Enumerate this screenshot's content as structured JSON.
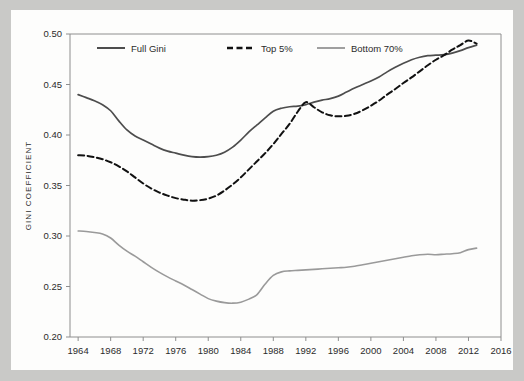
{
  "figure": {
    "background_color": "#c9c9c7",
    "plot_background_color": "#fdfdfc",
    "axis_color": "#8e8e8e"
  },
  "chart_data": {
    "type": "line",
    "title": "",
    "xlabel": "",
    "ylabel": "GINI COEFFICIENT",
    "xlim": [
      1963,
      2016
    ],
    "ylim": [
      0.2,
      0.5
    ],
    "grid": false,
    "legend_position": "top-left-inside",
    "xticks": [
      1964,
      1968,
      1972,
      1976,
      1980,
      1984,
      1988,
      1992,
      1996,
      2000,
      2004,
      2008,
      2012,
      2016
    ],
    "xtick_labels": [
      "1964",
      "1968",
      "1972",
      "1976",
      "1980",
      "1984",
      "1988",
      "1992",
      "1996",
      "2000",
      "2004",
      "2008",
      "2012",
      "2016"
    ],
    "yticks": [
      0.2,
      0.25,
      0.3,
      0.35,
      0.4,
      0.45,
      0.5
    ],
    "ytick_labels": [
      "0.20",
      "0.25",
      "0.30",
      "0.35",
      "0.40",
      "0.45",
      "0.50"
    ],
    "x": [
      1964,
      1965,
      1966,
      1967,
      1968,
      1969,
      1970,
      1971,
      1972,
      1973,
      1974,
      1975,
      1976,
      1977,
      1978,
      1979,
      1980,
      1981,
      1982,
      1983,
      1984,
      1985,
      1986,
      1987,
      1988,
      1989,
      1990,
      1991,
      1992,
      1993,
      1994,
      1995,
      1996,
      1997,
      1998,
      1999,
      2000,
      2001,
      2002,
      2003,
      2004,
      2005,
      2006,
      2007,
      2008,
      2009,
      2010,
      2011,
      2012,
      2013
    ],
    "series": [
      {
        "name": "Full Gini",
        "color": "#4d4d4d",
        "style": "solid",
        "width": 1.7,
        "values": [
          0.44,
          0.437,
          0.434,
          0.43,
          0.424,
          0.414,
          0.405,
          0.399,
          0.395,
          0.391,
          0.387,
          0.384,
          0.382,
          0.38,
          0.3785,
          0.378,
          0.3785,
          0.38,
          0.383,
          0.388,
          0.395,
          0.403,
          0.41,
          0.417,
          0.4235,
          0.4265,
          0.428,
          0.4285,
          0.43,
          0.4325,
          0.4345,
          0.436,
          0.4385,
          0.4425,
          0.4465,
          0.45,
          0.4535,
          0.4575,
          0.4625,
          0.467,
          0.471,
          0.4745,
          0.477,
          0.4785,
          0.479,
          0.4795,
          0.481,
          0.4835,
          0.4865,
          0.489
        ]
      },
      {
        "name": "Top 5%",
        "color": "#111111",
        "style": "dashed",
        "width": 2.0,
        "values": [
          0.38,
          0.3795,
          0.378,
          0.376,
          0.373,
          0.369,
          0.364,
          0.358,
          0.352,
          0.347,
          0.343,
          0.34,
          0.3375,
          0.336,
          0.335,
          0.3355,
          0.337,
          0.34,
          0.345,
          0.351,
          0.358,
          0.366,
          0.374,
          0.382,
          0.391,
          0.401,
          0.411,
          0.423,
          0.4325,
          0.4275,
          0.4225,
          0.4195,
          0.4185,
          0.419,
          0.421,
          0.4245,
          0.429,
          0.434,
          0.44,
          0.4455,
          0.4515,
          0.457,
          0.463,
          0.469,
          0.4745,
          0.479,
          0.4845,
          0.489,
          0.4935,
          0.4905
        ]
      },
      {
        "name": "Bottom 70%",
        "color": "#9a9a9a",
        "style": "solid",
        "width": 1.6,
        "values": [
          0.305,
          0.3045,
          0.3035,
          0.302,
          0.298,
          0.291,
          0.285,
          0.28,
          0.2745,
          0.269,
          0.264,
          0.2595,
          0.2555,
          0.2515,
          0.247,
          0.2425,
          0.238,
          0.2355,
          0.234,
          0.2335,
          0.2345,
          0.2375,
          0.242,
          0.2525,
          0.261,
          0.2645,
          0.2655,
          0.266,
          0.2665,
          0.267,
          0.2675,
          0.268,
          0.2685,
          0.269,
          0.27,
          0.2715,
          0.273,
          0.2745,
          0.276,
          0.2775,
          0.279,
          0.2805,
          0.2815,
          0.282,
          0.2815,
          0.282,
          0.2825,
          0.2835,
          0.2865,
          0.288
        ]
      }
    ]
  },
  "legend": {
    "items": [
      {
        "label": "Full Gini"
      },
      {
        "label": "Top 5%"
      },
      {
        "label": "Bottom 70%"
      }
    ]
  }
}
